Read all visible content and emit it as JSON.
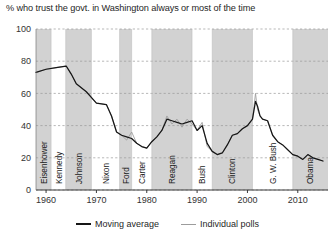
{
  "chart_data": {
    "type": "line",
    "title": "% who trust the govt. in Washington always or most of the time",
    "xlabel": "",
    "ylabel": "",
    "xlim": [
      1958,
      2016
    ],
    "ylim": [
      0,
      100
    ],
    "yticks": [
      0,
      20,
      40,
      60,
      80,
      100
    ],
    "xticks": [
      1960,
      1970,
      1980,
      1990,
      2000,
      2010
    ],
    "grid": true,
    "legend_position": "bottom-center",
    "legend": [
      {
        "name": "Moving average",
        "color": "#161616"
      },
      {
        "name": "Individual polls",
        "color": "#9c9c9c"
      }
    ],
    "shaded_bands": [
      {
        "label": "Eisenhower",
        "start": 1958,
        "end": 1961
      },
      {
        "label": "Kennedy",
        "start": 1961,
        "end": 1963.9
      },
      {
        "label": "Johnson",
        "start": 1963.9,
        "end": 1969
      },
      {
        "label": "Nixon",
        "start": 1969,
        "end": 1974.6
      },
      {
        "label": "Ford",
        "start": 1974.6,
        "end": 1977
      },
      {
        "label": "Carter",
        "start": 1977,
        "end": 1981
      },
      {
        "label": "Reagan",
        "start": 1981,
        "end": 1989
      },
      {
        "label": "Bush",
        "start": 1989,
        "end": 1993
      },
      {
        "label": "Clinton",
        "start": 1993,
        "end": 2001
      },
      {
        "label": "G. W. Bush",
        "start": 2001,
        "end": 2009
      },
      {
        "label": "Obama",
        "start": 2009,
        "end": 2016
      }
    ],
    "shaded_band_indices": [
      0,
      2,
      4,
      6,
      8,
      10
    ],
    "series": [
      {
        "name": "Moving average",
        "color": "#161616",
        "x": [
          1958,
          1960,
          1962,
          1964,
          1965,
          1966,
          1968,
          1970,
          1972,
          1973,
          1974,
          1975,
          1976,
          1977,
          1978,
          1979,
          1980,
          1981,
          1982,
          1983,
          1984,
          1985,
          1986,
          1987,
          1988,
          1989,
          1990,
          1991,
          1992,
          1993,
          1994,
          1995,
          1996,
          1997,
          1998,
          1999,
          2000,
          2001,
          2001.6,
          2002,
          2002.5,
          2003,
          2004,
          2005,
          2006,
          2007,
          2008,
          2009,
          2010,
          2011,
          2012,
          2013,
          2014,
          2015
        ],
        "values": [
          73,
          75,
          76,
          77,
          72,
          66,
          61,
          54,
          53,
          46,
          36,
          34,
          33,
          32,
          29,
          27,
          26,
          30,
          33,
          37,
          44,
          43,
          42,
          41,
          42,
          43,
          37,
          40,
          29,
          24,
          22,
          23,
          28,
          34,
          35,
          38,
          40,
          44,
          55,
          52,
          46,
          44,
          43,
          34,
          30,
          28,
          25,
          22,
          21,
          19,
          22,
          20,
          19,
          18
        ]
      },
      {
        "name": "Individual polls",
        "color": "#9c9c9c",
        "x": [
          1958,
          1960,
          1962,
          1964,
          1965,
          1966,
          1968,
          1970,
          1972,
          1973,
          1974,
          1975,
          1976,
          1977,
          1978,
          1979,
          1980,
          1981,
          1982,
          1983,
          1984,
          1985,
          1986,
          1987,
          1988,
          1989,
          1990,
          1991,
          1992,
          1993,
          1994,
          1995,
          1996,
          1997,
          1998,
          1999,
          2000,
          2001,
          2001.6,
          2002,
          2002.5,
          2003,
          2004,
          2005,
          2006,
          2007,
          2008,
          2009,
          2010,
          2011,
          2012,
          2013,
          2014,
          2015
        ],
        "values": [
          73,
          75,
          76,
          77,
          72,
          66,
          61,
          54,
          53,
          46,
          36,
          34,
          31,
          36,
          29,
          27,
          26,
          30,
          33,
          37,
          46,
          41,
          44,
          39,
          44,
          41,
          37,
          42,
          27,
          24,
          22,
          23,
          28,
          34,
          35,
          38,
          40,
          44,
          60,
          50,
          46,
          44,
          43,
          34,
          30,
          28,
          25,
          22,
          21,
          19,
          22,
          20,
          19,
          18
        ]
      }
    ],
    "annotations": {
      "peak_2001_value": 60,
      "peak_2001_note": "post-9/11 spike",
      "start_value": 73,
      "max_value": 77,
      "end_value": 18
    }
  }
}
